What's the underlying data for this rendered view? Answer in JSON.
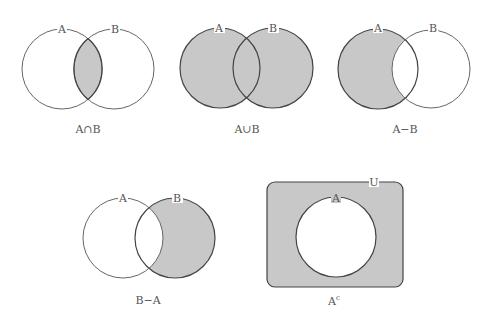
{
  "colors": {
    "background": "#ffffff",
    "shade": "#c8c8c8",
    "stroke_dark": "#444444",
    "stroke_light": "#666666",
    "text": "#555555"
  },
  "diagrams": [
    {
      "id": "intersection",
      "caption": "A∩B",
      "sets": [
        {
          "label": "A"
        },
        {
          "label": "B"
        }
      ],
      "shaded_region": "A and B overlap"
    },
    {
      "id": "union",
      "caption": "A∪B",
      "sets": [
        {
          "label": "A"
        },
        {
          "label": "B"
        }
      ],
      "shaded_region": "all of A and B"
    },
    {
      "id": "a-minus-b",
      "caption": "A−B",
      "sets": [
        {
          "label": "A"
        },
        {
          "label": "B"
        }
      ],
      "shaded_region": "A outside B"
    },
    {
      "id": "b-minus-a",
      "caption": "B−A",
      "sets": [
        {
          "label": "A"
        },
        {
          "label": "B"
        }
      ],
      "shaded_region": "B outside A"
    },
    {
      "id": "complement",
      "caption_base": "A",
      "caption_sup": "c",
      "sets": [
        {
          "label": "A"
        }
      ],
      "universe_label": "U",
      "shaded_region": "U outside A"
    }
  ]
}
